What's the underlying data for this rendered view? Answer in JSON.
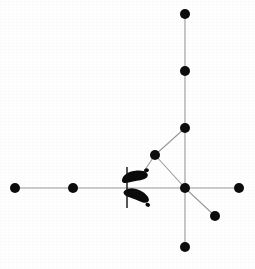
{
  "figure": {
    "background_color": "#fefefe",
    "node_color": "#0d0d0d",
    "edge_color": "#9a9a9a",
    "footprint_color": "#0b0b0b",
    "width": 255,
    "height": 269
  },
  "chart_data": {
    "type": "scatter",
    "xlabel": "",
    "ylabel": "",
    "xlim": [
      0,
      255
    ],
    "ylim": [
      0,
      269
    ],
    "grid": false,
    "legend": "none",
    "node_radius": 5,
    "nodes": [
      {
        "id": "n1",
        "label": "top-end",
        "x": 185,
        "y": 14
      },
      {
        "id": "n2",
        "label": "upper-mid",
        "x": 185,
        "y": 71
      },
      {
        "id": "n3",
        "label": "branch-junction",
        "x": 185,
        "y": 128
      },
      {
        "id": "n4",
        "label": "diagonal-mid",
        "x": 155,
        "y": 155
      },
      {
        "id": "n5",
        "label": "hub-center",
        "x": 185,
        "y": 188
      },
      {
        "id": "n6",
        "label": "left-far-end",
        "x": 15,
        "y": 188
      },
      {
        "id": "n7",
        "label": "left-mid",
        "x": 73,
        "y": 188
      },
      {
        "id": "n8",
        "label": "right-end",
        "x": 239,
        "y": 188
      },
      {
        "id": "n9",
        "label": "lower-right-end",
        "x": 215,
        "y": 216
      },
      {
        "id": "n10",
        "label": "bottom-end",
        "x": 185,
        "y": 247
      }
    ],
    "edges": [
      {
        "from": "n1",
        "to": "n2"
      },
      {
        "from": "n2",
        "to": "n3"
      },
      {
        "from": "n3",
        "to": "n5"
      },
      {
        "from": "n3",
        "to": "n4"
      },
      {
        "from": "n4",
        "to": "n5"
      },
      {
        "from": "n4",
        "to": "n_foot_upper"
      },
      {
        "from": "n5",
        "to": "n10"
      },
      {
        "from": "n5",
        "to": "n8"
      },
      {
        "from": "n5",
        "to": "n9"
      },
      {
        "from": "n6",
        "to": "n7"
      },
      {
        "from": "n7",
        "to": "n5"
      }
    ],
    "annotations": [
      {
        "kind": "footprint",
        "label": "left-foot-upper",
        "x": 136,
        "y": 178,
        "rotation": -18
      },
      {
        "kind": "footprint",
        "label": "left-foot-lower",
        "x": 137,
        "y": 197,
        "rotation": 16
      },
      {
        "kind": "tick",
        "label": "start-marker-tick",
        "x": 127,
        "y1": 167,
        "y2": 208
      }
    ]
  }
}
